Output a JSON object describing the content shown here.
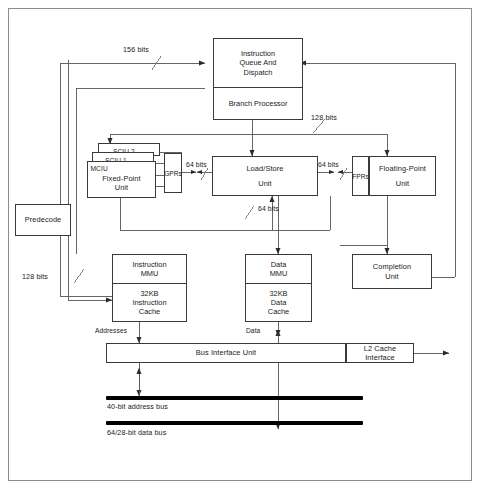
{
  "diagram": {
    "blocks": {
      "instruction_queue": {
        "line1": "Instruction",
        "line2": "Queue And",
        "line3": "Dispatch"
      },
      "branch_processor": {
        "line1": "Branch Processor"
      },
      "sciu2": {
        "label": "SCIU 2"
      },
      "sciu1": {
        "label": "SCIU 1"
      },
      "mciu": {
        "tag": "MCIU",
        "line1": "Fixed-Point",
        "line2": "Unit"
      },
      "gprs": {
        "label": "GPRs"
      },
      "fprs": {
        "label": "FPRs"
      },
      "load_store": {
        "line1": "Load/Store",
        "line2": "Unit"
      },
      "floating_point": {
        "line1": "Floating-Point",
        "line2": "Unit"
      },
      "predecode": {
        "label": "Predecode"
      },
      "instruction_mmu": {
        "line1": "Instruction",
        "line2": "MMU"
      },
      "instruction_cache": {
        "line1": "32KB",
        "line2": "Instruction",
        "line3": "Cache"
      },
      "data_mmu": {
        "line1": "Data",
        "line2": "MMU"
      },
      "data_cache": {
        "line1": "32KB",
        "line2": "Data",
        "line3": "Cache"
      },
      "completion_unit": {
        "line1": "Completion",
        "line2": "Unit"
      },
      "bus_interface_unit": {
        "label": "Bus Interface Unit"
      },
      "l2_cache_interface": {
        "line1": "L2 Cache",
        "line2": "Interface"
      }
    },
    "bus_labels": {
      "bits_156": "156 bits",
      "bits_128_top": "128 bits",
      "bits_64_gpr": "64 bits",
      "bits_64_fpr": "64 bits",
      "bits_64_lsu": "64 bits",
      "bits_128_left": "128 bits",
      "addresses": "Addresses",
      "data": "Data",
      "address_bus": "40-bit address bus",
      "data_bus": "64/28-bit data bus"
    },
    "colors": {
      "line": "#3a3a3a",
      "text": "#1a1a1a",
      "bus_bar": "#000000",
      "frame": "#8c8c8c",
      "background": "#ffffff"
    }
  }
}
